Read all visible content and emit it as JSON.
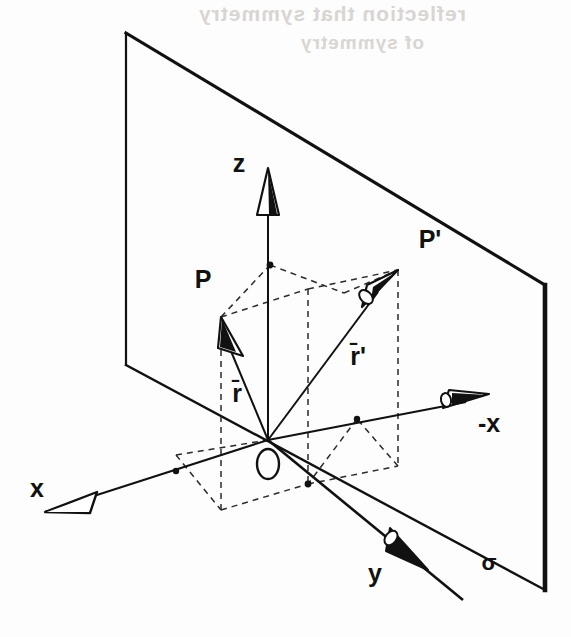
{
  "figure": {
    "type": "technical-line-diagram",
    "background_color": "#fdfdfd",
    "ink_color": "#111111"
  },
  "bleedthrough_text": {
    "line1": "reflection that symmetry",
    "line2": "of symmetry"
  },
  "labels": {
    "axis_z": "z",
    "axis_x": "x",
    "axis_minus_x": "-x",
    "axis_y": "y",
    "origin": "O",
    "point_p": "P",
    "point_p_prime": "P'",
    "vector_r": "r̄",
    "vector_r_prime": "r̄'",
    "plane_sigma": "σ"
  },
  "geometry": {
    "origin": {
      "x": 268,
      "y": 440
    },
    "point_p": {
      "x": 221,
      "y": 317
    },
    "point_p_prime": {
      "x": 398,
      "y": 270
    },
    "z_axis_tip": {
      "x": 268,
      "y": 168
    },
    "x_axis_tip": {
      "x": 45,
      "y": 512
    },
    "minus_x_axis_tip": {
      "x": 489,
      "y": 394
    },
    "y_axis_tip": {
      "x": 463,
      "y": 600
    },
    "plane_corners": [
      {
        "x": 126,
        "y": 33
      },
      {
        "x": 545,
        "y": 285
      },
      {
        "x": 545,
        "y": 590
      },
      {
        "x": 126,
        "y": 365
      }
    ]
  },
  "colors": {
    "ink": "#111111",
    "dashed": "#2a2a2a",
    "bleed": "#d8d5d2",
    "paper": "#fdfdfd"
  }
}
